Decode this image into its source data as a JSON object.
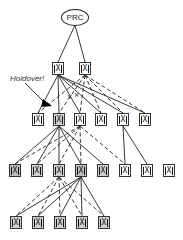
{
  "root": {
    "label": "PRC"
  },
  "annotation": {
    "label": "Holdover!"
  },
  "levels": [
    {
      "name": "level-1",
      "nodes": [
        {
          "id": "L1-1",
          "filled": false
        },
        {
          "id": "L1-2",
          "filled": false
        }
      ]
    },
    {
      "name": "level-2",
      "nodes": [
        {
          "id": "L2-1",
          "filled": false
        },
        {
          "id": "L2-2",
          "filled": true
        },
        {
          "id": "L2-3",
          "filled": false
        },
        {
          "id": "L2-4",
          "filled": false
        },
        {
          "id": "L2-5",
          "filled": false
        },
        {
          "id": "L2-6",
          "filled": false
        }
      ]
    },
    {
      "name": "level-3",
      "nodes": [
        {
          "id": "L3-1",
          "filled": true
        },
        {
          "id": "L3-2",
          "filled": true
        },
        {
          "id": "L3-3",
          "filled": true
        },
        {
          "id": "L3-4",
          "filled": true
        },
        {
          "id": "L3-5",
          "filled": false
        },
        {
          "id": "L3-6",
          "filled": false
        },
        {
          "id": "L3-7",
          "filled": false
        },
        {
          "id": "L3-8",
          "filled": false
        }
      ]
    },
    {
      "name": "level-4",
      "nodes": [
        {
          "id": "L4-1",
          "filled": true
        },
        {
          "id": "L4-2",
          "filled": true
        },
        {
          "id": "L4-3",
          "filled": true
        },
        {
          "id": "L4-4",
          "filled": true
        },
        {
          "id": "L4-5",
          "filled": true
        }
      ]
    }
  ],
  "node_glyph": "X",
  "edges": {
    "solid": [
      [
        "PRC",
        "L1-1"
      ],
      [
        "PRC",
        "L1-2"
      ],
      [
        "L1-1",
        "L2-1"
      ],
      [
        "L1-1",
        "L2-2"
      ],
      [
        "L1-1",
        "L2-3"
      ],
      [
        "L1-1",
        "L2-4"
      ],
      [
        "L1-1",
        "L2-5"
      ],
      [
        "L1-1",
        "L2-6"
      ],
      [
        "L2-2",
        "L3-1"
      ],
      [
        "L2-2",
        "L3-2"
      ],
      [
        "L2-2",
        "L3-3"
      ],
      [
        "L2-2",
        "L3-4"
      ],
      [
        "L2-2",
        "L3-5"
      ],
      [
        "L2-5",
        "L3-6"
      ],
      [
        "L2-5",
        "L3-7"
      ],
      [
        "L3-4",
        "L4-1"
      ],
      [
        "L3-4",
        "L4-2"
      ],
      [
        "L3-4",
        "L4-3"
      ],
      [
        "L3-4",
        "L4-4"
      ],
      [
        "L3-4",
        "L4-5"
      ]
    ],
    "dashed": [
      [
        "L1-2",
        "L2-1"
      ],
      [
        "L1-2",
        "L2-2"
      ],
      [
        "L1-2",
        "L2-3"
      ],
      [
        "L1-2",
        "L2-4"
      ],
      [
        "L1-2",
        "L2-5"
      ],
      [
        "L1-2",
        "L2-6"
      ],
      [
        "L2-3",
        "L3-1"
      ],
      [
        "L2-3",
        "L3-2"
      ],
      [
        "L2-3",
        "L3-3"
      ],
      [
        "L2-3",
        "L3-4"
      ],
      [
        "L2-3",
        "L3-6"
      ],
      [
        "L3-3",
        "L4-1"
      ],
      [
        "L3-3",
        "L4-2"
      ],
      [
        "L3-3",
        "L4-3"
      ],
      [
        "L3-3",
        "L4-4"
      ],
      [
        "L3-3",
        "L4-5"
      ]
    ],
    "broken": [
      [
        "L1-2",
        "L2-2"
      ]
    ]
  },
  "colors": {
    "line": "#222222",
    "node_fill": "#cfcfcf",
    "node_border": "#333333"
  }
}
